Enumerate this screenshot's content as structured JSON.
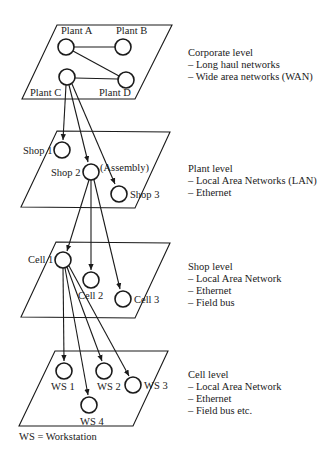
{
  "levels": [
    {
      "title": "Corporate level",
      "items": [
        "– Long haul networks",
        "– Wide area networks (WAN)"
      ],
      "nodes": [
        "Plant A",
        "Plant B",
        "Plant C",
        "Plant D"
      ]
    },
    {
      "title": "Plant level",
      "items": [
        "– Local Area Networks (LAN)",
        "– Ethernet"
      ],
      "nodes": [
        "Shop 1",
        "Shop 2",
        "Shop 3"
      ],
      "annotation": "(Assembly)"
    },
    {
      "title": "Shop level",
      "items": [
        "– Local Area Network",
        "– Ethernet",
        "– Field bus"
      ],
      "nodes": [
        "Cell 1",
        "Cell 2",
        "Cell 3"
      ]
    },
    {
      "title": "Cell level",
      "items": [
        "– Local Area Network",
        "– Ethernet",
        "– Field bus etc."
      ],
      "nodes": [
        "WS 1",
        "WS 2",
        "WS 3",
        "WS 4"
      ]
    }
  ],
  "footnote": "WS = Workstation",
  "colors": {
    "ink": "#1a1a1a",
    "background": "#ffffff"
  }
}
